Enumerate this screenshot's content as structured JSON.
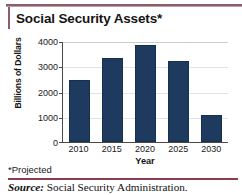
{
  "title": "Social Security Assets*",
  "footnote": "*Projected",
  "source": {
    "keyword": "Source:",
    "text": " Social Security Administration."
  },
  "colors": {
    "bar": "#1e3a5f",
    "accent_rule": "#8d5d6b",
    "source_rule": "#8d3d50",
    "gridline": "#dfe4ea",
    "axis": "#4a4a4a"
  },
  "chart_data": {
    "type": "bar",
    "title": "Social Security Assets*",
    "xlabel": "Year",
    "ylabel": "Billions of Dollars",
    "categories": [
      "2010",
      "2015",
      "2020",
      "2025",
      "2030"
    ],
    "values": [
      2500,
      3350,
      3900,
      3250,
      1100
    ],
    "ylim": [
      0,
      4000
    ],
    "yticks": [
      "4000",
      "3000",
      "2000",
      "1000",
      "0"
    ],
    "ytick_values": [
      4000,
      3000,
      2000,
      1000,
      0
    ],
    "grid": true,
    "legend": "none",
    "series": [
      {
        "name": "Social Security Assets",
        "values": [
          2500,
          3350,
          3900,
          3250,
          1100
        ]
      }
    ],
    "annotations": [
      "*Projected",
      "Source: Social Security Administration."
    ]
  }
}
